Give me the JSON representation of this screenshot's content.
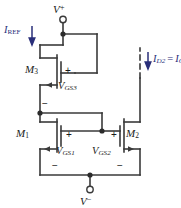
{
  "figure": {
    "type": "circuit-schematic"
  },
  "colors": {
    "wire": "#3a3a3a",
    "label_black": "#1b1b1b",
    "label_blue": "#2a2f7a",
    "background": "#ffffff"
  },
  "rails": {
    "positive": {
      "name": "V+",
      "symbol": "V",
      "sign": "+"
    },
    "negative": {
      "name": "V-",
      "symbol": "V",
      "sign": "−"
    }
  },
  "currents": [
    {
      "id": "iref",
      "symbol": "I",
      "subscript": "REF",
      "text": "I_REF",
      "color": "#2a2f7a",
      "direction": "down",
      "style": "solid"
    },
    {
      "id": "id2",
      "symbol": "I",
      "subscript": "D2",
      "equals": "=",
      "symbol2": "I",
      "subscript2": "O",
      "text": "I_D2 = I_O",
      "color": "#2a2f7a",
      "direction": "down",
      "style": "dashed"
    }
  ],
  "transistors": [
    {
      "id": "m3",
      "label_symbol": "M",
      "label_sub": "3",
      "text": "M3",
      "connection": "diode-connected"
    },
    {
      "id": "m1",
      "label_symbol": "M",
      "label_sub": "1",
      "text": "M1",
      "connection": "mirror-input"
    },
    {
      "id": "m2",
      "label_symbol": "M",
      "label_sub": "2",
      "text": "M2",
      "connection": "mirror-output"
    }
  ],
  "voltages": [
    {
      "id": "vgs3",
      "symbol": "V",
      "subscript": "GS3",
      "text": "V_GS3",
      "plus": "+",
      "minus": "−"
    },
    {
      "id": "vgs1",
      "symbol": "V",
      "subscript": "GS1",
      "text": "V_GS1",
      "plus": "+",
      "minus": "−"
    },
    {
      "id": "vgs2",
      "symbol": "V",
      "subscript": "GS2",
      "text": "V_GS2",
      "plus": "+",
      "minus": "−"
    }
  ],
  "nodes": [
    {
      "id": "top-rail-node",
      "shape": "dot"
    },
    {
      "id": "m3-drain-node",
      "shape": "dot"
    },
    {
      "id": "gate-bus-node",
      "shape": "dot"
    },
    {
      "id": "bottom-rail-node",
      "shape": "dot"
    }
  ],
  "terminals": [
    {
      "id": "vplus-terminal",
      "shape": "open-circle"
    },
    {
      "id": "vminus-terminal",
      "shape": "open-circle"
    }
  ]
}
